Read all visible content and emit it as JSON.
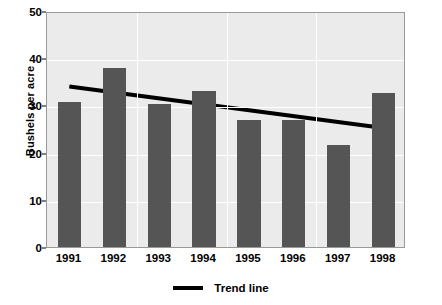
{
  "chart_data": {
    "type": "bar",
    "title": "",
    "subtitle": "",
    "xlabel": "",
    "ylabel": "Bushels per acre",
    "categories": [
      "1991",
      "1992",
      "1993",
      "1994",
      "1995",
      "1996",
      "1997",
      "1998"
    ],
    "values": [
      30.7,
      38.0,
      30.2,
      33.0,
      27.0,
      27.0,
      21.7,
      32.7
    ],
    "series": [
      {
        "name": "Bushels per acre",
        "type": "bar",
        "values": [
          30.7,
          38.0,
          30.2,
          33.0,
          27.0,
          27.0,
          21.7,
          32.7
        ],
        "color": "#555555"
      },
      {
        "name": "Trend line",
        "type": "line",
        "color": "#000000",
        "x_start_category": "1991",
        "x_end_category": "1998",
        "y_start": 34.3,
        "y_end": 25.5,
        "values": [
          34.3,
          33.0,
          31.8,
          30.5,
          29.3,
          28.0,
          26.8,
          25.5
        ]
      }
    ],
    "ylim": [
      0,
      50
    ],
    "yticks": [
      0,
      10,
      20,
      30,
      40,
      50
    ],
    "ytick_labels": [
      "0",
      "10",
      "20",
      "30",
      "40",
      "50"
    ],
    "grid": {
      "horizontal": true,
      "vertical": true,
      "color": "#ffffff"
    },
    "plot_background": "#ebebeb",
    "figure_background": "#ffffff",
    "legend": {
      "position": "bottom-center",
      "entries": [
        {
          "label": "Trend line",
          "marker": "line",
          "color": "#000000"
        }
      ]
    },
    "annotations": []
  }
}
